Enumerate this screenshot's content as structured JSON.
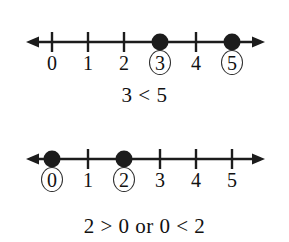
{
  "figures": [
    {
      "id": "first-number-line",
      "axis": {
        "arrow_left": true,
        "arrow_right": true,
        "min_label": 0,
        "max_label": 5
      },
      "ticks": [
        {
          "value": 0,
          "label": "0",
          "marker": "tick",
          "circled": false
        },
        {
          "value": 1,
          "label": "1",
          "marker": "tick",
          "circled": false
        },
        {
          "value": 2,
          "label": "2",
          "marker": "tick",
          "circled": false
        },
        {
          "value": 3,
          "label": "3",
          "marker": "dot",
          "circled": true
        },
        {
          "value": 4,
          "label": "4",
          "marker": "tick",
          "circled": false
        },
        {
          "value": 5,
          "label": "5",
          "marker": "dot",
          "circled": true
        }
      ],
      "expression": "3 < 5"
    },
    {
      "id": "second-number-line",
      "axis": {
        "arrow_left": true,
        "arrow_right": true,
        "min_label": 0,
        "max_label": 5
      },
      "ticks": [
        {
          "value": 0,
          "label": "0",
          "marker": "dot",
          "circled": true
        },
        {
          "value": 1,
          "label": "1",
          "marker": "tick",
          "circled": false
        },
        {
          "value": 2,
          "label": "2",
          "marker": "dot",
          "circled": true
        },
        {
          "value": 3,
          "label": "3",
          "marker": "tick",
          "circled": false
        },
        {
          "value": 4,
          "label": "4",
          "marker": "tick",
          "circled": false
        },
        {
          "value": 5,
          "label": "5",
          "marker": "tick",
          "circled": false
        }
      ],
      "expression": "2 > 0 or 0 < 2"
    }
  ],
  "geometry": {
    "origin_x": 52,
    "step_x": 36,
    "axis_left_x": 26,
    "axis_right_x": 265
  },
  "colors": {
    "ink": "#1c1c1c",
    "background": "#ffffff"
  }
}
